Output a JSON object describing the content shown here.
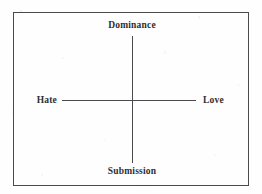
{
  "figure": {
    "type": "quadrant-diagram",
    "background_color": "#fefefe",
    "line_color": "#4a4a4e",
    "text_color": "#2e2e31",
    "axes": {
      "vertical": {
        "top_label": "Dominance",
        "bottom_label": "Submission"
      },
      "horizontal": {
        "left_label": "Hate",
        "right_label": "Love"
      }
    }
  },
  "chart_data": {
    "type": "scatter",
    "title": "",
    "xlabel": "",
    "ylabel": "",
    "grid": false,
    "legend": "none",
    "axis_style": "crossed-axes-centered",
    "x_axis": {
      "negative_label": "Hate",
      "positive_label": "Love",
      "range": [
        -1,
        1
      ]
    },
    "y_axis": {
      "negative_label": "Submission",
      "positive_label": "Dominance",
      "range": [
        -1,
        1
      ]
    },
    "points": [],
    "annotations": [
      "Dominance",
      "Submission",
      "Hate",
      "Love"
    ]
  }
}
